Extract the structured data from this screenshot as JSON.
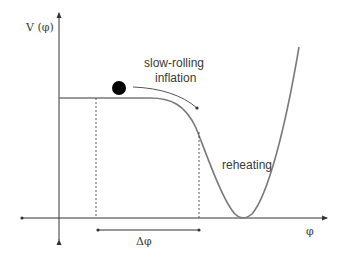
{
  "diagram": {
    "y_axis_label": "V (φ)",
    "x_axis_label": "φ",
    "annotations": {
      "slow_roll_line1": "slow-rolling",
      "slow_roll_line2": "inflation",
      "reheating": "reheating",
      "delta_phi": "Δφ"
    },
    "colors": {
      "curve": "#7a7a7a",
      "axis": "#333333",
      "ball": "#000000",
      "text": "#3a3a3a"
    }
  }
}
